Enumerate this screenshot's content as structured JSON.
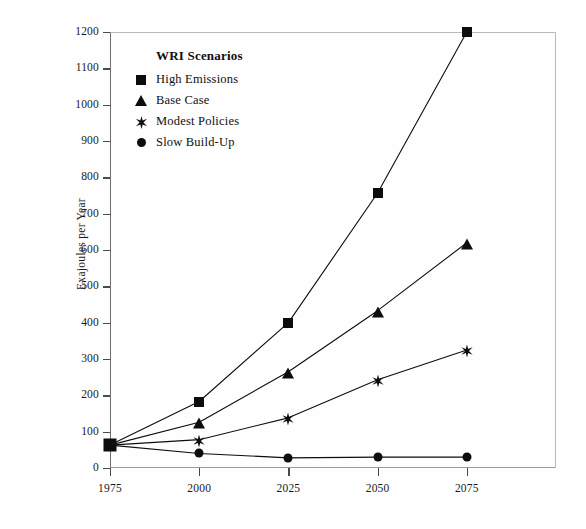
{
  "chart_data": {
    "type": "line",
    "title": "",
    "xlabel": "",
    "ylabel": "Exajoules per Year",
    "x": [
      1975,
      2000,
      2025,
      2050,
      2075
    ],
    "xticklabels": [
      "1975",
      "2000",
      "2025",
      "2050",
      "2075"
    ],
    "xlim": [
      1975,
      2100
    ],
    "ylim": [
      0,
      1200
    ],
    "yticks": [
      0,
      100,
      200,
      300,
      400,
      500,
      600,
      700,
      800,
      900,
      1000,
      1100,
      1200
    ],
    "yticklabels": [
      "0",
      "100",
      "200",
      "300",
      "400",
      "500",
      "600",
      "700",
      "800",
      "900",
      "1000",
      "1100",
      "1200"
    ],
    "grid": false,
    "legend_position": "upper-left-inside",
    "legend_title": "WRI Scenarios",
    "series": [
      {
        "name": "High Emissions",
        "marker": "square",
        "color": "#0d0d0d",
        "values": [
          63,
          183,
          400,
          757,
          1200
        ]
      },
      {
        "name": "Base Case",
        "marker": "triangle",
        "color": "#0d0d0d",
        "values": [
          63,
          126,
          265,
          433,
          620
        ]
      },
      {
        "name": "Modest Policies",
        "marker": "star",
        "color": "#0d0d0d",
        "values": [
          63,
          78,
          138,
          243,
          325
        ]
      },
      {
        "name": "Slow Build-Up",
        "marker": "circle",
        "color": "#0d0d0d",
        "values": [
          63,
          40,
          28,
          30,
          30
        ]
      }
    ]
  },
  "legend": {
    "title": "WRI Scenarios",
    "items": [
      {
        "label": "High Emissions",
        "marker": "square"
      },
      {
        "label": "Base Case",
        "marker": "triangle"
      },
      {
        "label": "Modest Policies",
        "marker": "star"
      },
      {
        "label": "Slow Build-Up",
        "marker": "circle"
      }
    ]
  },
  "axes": {
    "y_title": "Exajoules per Year"
  }
}
